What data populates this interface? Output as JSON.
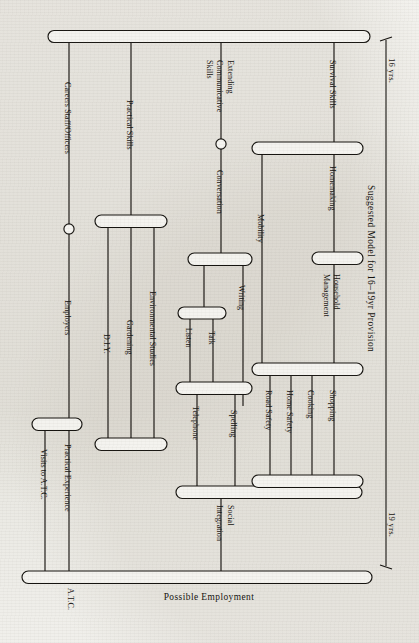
{
  "figure": {
    "title": "Suggested Model for 16–19yr Provision",
    "axis_start": "16 yrs.",
    "axis_end": "19 yrs.",
    "footer": "Possible Employment"
  },
  "branches": {
    "careers_staff": "Careers Staff/Officers",
    "employers": "Employers",
    "practical_experience": "Practical Experience",
    "visits_to_atc": "Visits to A.T.C.",
    "atc": "A.T.C.",
    "practical_skills": "Practical Skills",
    "diy": "D.I.Y.",
    "gardening": "Gardening",
    "environmental_studies": "Environmental Studies",
    "extending_communicative_skills_line1": "Extending",
    "extending_communicative_skills_line2": "Communicative",
    "extending_communicative_skills_line3": "Skills",
    "conversation": "Conversation",
    "listen": "Listen",
    "talk": "Talk",
    "telephone": "Telephone",
    "writing": "Writing",
    "spelling": "Spelling",
    "social_integration_line1": "Social",
    "social_integration_line2": "Integration",
    "survival_skills": "Survival Skills",
    "mobility": "Mobility",
    "road_safety": "Road Safety",
    "home_safety": "Home Safety",
    "homemaking": "Homemaking",
    "household_management_line1": "Household",
    "household_management_line2": "Management",
    "cooking": "Cooking",
    "shopping": "Shopping"
  },
  "colors": {
    "ink": "#15130f",
    "paper": "#efeeea",
    "bar_fill": "#f4f3ef"
  }
}
